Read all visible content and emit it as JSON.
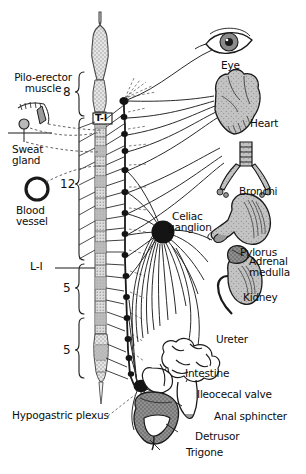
{
  "figure": {
    "type": "anatomical-diagram",
    "background_color": "#ffffff",
    "ink_color": "#1a1a1a",
    "organ_fill": "#b9b9b9",
    "cord_fill": "#d8d8d8"
  },
  "spinal_cord": {
    "top_label": "T-I",
    "segments": [
      {
        "name": "cervical",
        "count_label": "8"
      },
      {
        "name": "thoracic",
        "count_label": "12"
      },
      {
        "name": "lumbar",
        "count_label": "5"
      },
      {
        "name": "sacral",
        "count_label": "5"
      }
    ],
    "lumbar_marker": "L-I"
  },
  "left_inset": {
    "pilo_erector": "Pilo-erector\nmuscle",
    "pilo_erector_line1": "Pilo-erector",
    "pilo_erector_line2": "muscle",
    "sweat_gland_line1": "Sweat",
    "sweat_gland_line2": "gland",
    "blood_vessel_line1": "Blood",
    "blood_vessel_line2": "vessel"
  },
  "ganglia": [
    {
      "name": "celiac-ganglion",
      "line1": "Celiac",
      "line2": "ganglion"
    },
    {
      "name": "hypogastric-plexus",
      "label": "Hypogastric plexus"
    }
  ],
  "organs": [
    {
      "name": "eye",
      "label": "Eye"
    },
    {
      "name": "heart",
      "label": "Heart"
    },
    {
      "name": "bronchi",
      "label": "Bronchi"
    },
    {
      "name": "pylorus",
      "label": "Pylorus"
    },
    {
      "name": "adrenal-medulla",
      "line1": "Adrenal",
      "line2": "medulla"
    },
    {
      "name": "kidney",
      "label": "Kidney"
    },
    {
      "name": "ureter",
      "label": "Ureter"
    },
    {
      "name": "intestine",
      "label": "Intestine"
    },
    {
      "name": "ileocecal-valve",
      "label": "Ileocecal valve"
    },
    {
      "name": "anal-sphincter",
      "label": "Anal sphincter"
    },
    {
      "name": "detrusor",
      "label": "Detrusor"
    },
    {
      "name": "trigone",
      "label": "Trigone"
    }
  ]
}
